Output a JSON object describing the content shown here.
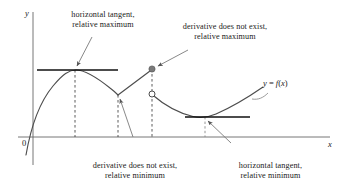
{
  "figure": {
    "type": "diagram",
    "axes": {
      "y_label": "y",
      "x_label": "x",
      "origin_label": "0",
      "axis_color": "#555555"
    },
    "curve_label": {
      "text": "y = f(x)",
      "lhs": "y",
      "equals": " = ",
      "rhs": "f(x)"
    },
    "annotations": [
      {
        "id": "horizontal-tangent-relative-maximum",
        "line1": "horizontal tangent,",
        "line2": "relative maximum",
        "points_to": "peak of left arc"
      },
      {
        "id": "derivative-dne-relative-maximum",
        "line1": "derivative does not exist,",
        "line2": "relative maximum",
        "points_to": "filled endpoint at jump discontinuity"
      },
      {
        "id": "derivative-dne-relative-minimum",
        "line1": "derivative does not exist,",
        "line2": "relative minimum",
        "points_to": "corner where arc meets rising line"
      },
      {
        "id": "horizontal-tangent-relative-minimum",
        "line1": "horizontal tangent,",
        "line2": "relative minimum",
        "points_to": "bottom of right parabola"
      }
    ],
    "markers": {
      "filled_point": "closed-circle-marker",
      "open_point": "open-circle-marker"
    },
    "colors": {
      "curve": "#4d4d4d",
      "tangent": "#111111",
      "dashed": "#333333",
      "leader": "#777777",
      "text": "#1a1a1a",
      "background": "#ffffff"
    }
  },
  "chart_data": {
    "type": "line",
    "title": "",
    "xlabel": "x",
    "ylabel": "y",
    "grid": false,
    "legend": null,
    "annotations": [
      "horizontal tangent, relative maximum",
      "derivative does not exist, relative maximum",
      "derivative does not exist, relative minimum",
      "horizontal tangent, relative minimum"
    ],
    "series": [
      {
        "name": "y = f(x)",
        "segments": [
          {
            "name": "left-arc",
            "description": "concave-down arc from below the x-axis through the y-axis up to a smooth maximum then down to a corner",
            "points": [
              [
                26,
                150
              ],
              [
                33,
                126
              ],
              [
                40,
                108
              ],
              [
                50,
                90
              ],
              [
                60,
                78
              ],
              [
                75,
                70
              ],
              [
                90,
                73
              ],
              [
                104,
                83
              ],
              [
                113,
                91
              ],
              [
                118,
                95
              ]
            ]
          },
          {
            "name": "rising-line",
            "description": "straight line segment from the corner up to the filled endpoint of the jump",
            "points": [
              [
                118,
                95
              ],
              [
                152,
                69
              ]
            ]
          },
          {
            "name": "right-parabola",
            "description": "concave-up curve from the open circle down to a smooth minimum then up to the right",
            "points": [
              [
                152,
                94
              ],
              [
                168,
                105
              ],
              [
                184,
                113
              ],
              [
                200,
                117
              ],
              [
                214,
                116
              ],
              [
                232,
                108
              ],
              [
                248,
                97
              ],
              [
                262,
                88
              ]
            ]
          }
        ]
      }
    ],
    "special_points": [
      {
        "label": "relative maximum (horizontal tangent)",
        "x": 75,
        "y": 70,
        "marker": "none"
      },
      {
        "label": "relative minimum (corner, derivative does not exist)",
        "x": 118,
        "y": 95,
        "marker": "none"
      },
      {
        "label": "relative maximum (derivative does not exist)",
        "x": 152,
        "y": 69,
        "marker": "closed-circle"
      },
      {
        "label": "jump discontinuity open endpoint",
        "x": 152,
        "y": 94,
        "marker": "open-circle"
      },
      {
        "label": "relative minimum (horizontal tangent)",
        "x": 205,
        "y": 117,
        "marker": "none"
      }
    ],
    "tangent_lines": [
      {
        "label": "horizontal tangent at left maximum",
        "y": 70,
        "x_start": 37,
        "x_end": 118
      },
      {
        "label": "horizontal tangent at right minimum",
        "y": 117,
        "x_start": 185,
        "x_end": 250
      }
    ],
    "dashed_verticals": [
      {
        "x": 75,
        "y_top": 70,
        "y_bottom": 137
      },
      {
        "x": 118,
        "y_top": 95,
        "y_bottom": 137
      },
      {
        "x": 152,
        "y_top": 69,
        "y_bottom": 137
      },
      {
        "x": 205,
        "y_top": 117,
        "y_bottom": 137
      }
    ],
    "axis_lines": {
      "x_axis": {
        "y": 137,
        "x_start": 18,
        "x_end": 330
      },
      "y_axis": {
        "x": 33,
        "y_top": 12,
        "y_bottom": 165
      }
    }
  }
}
